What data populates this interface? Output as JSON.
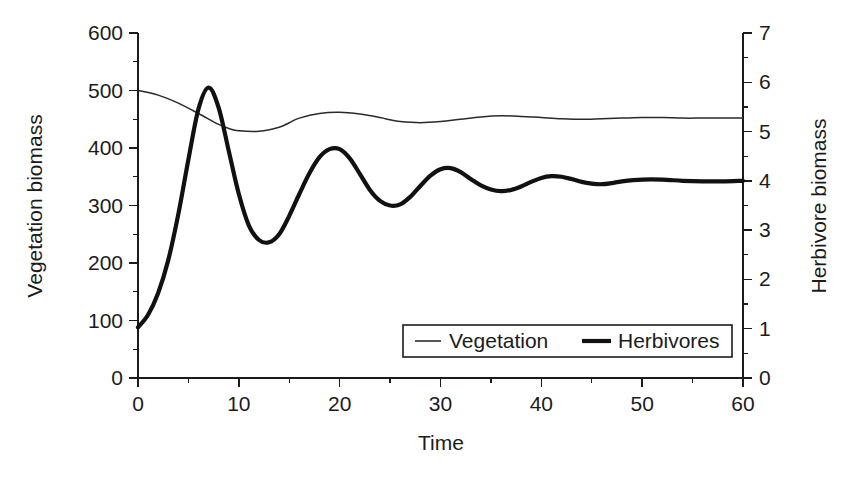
{
  "chart_data": {
    "type": "line",
    "title": "",
    "xlabel": "Time",
    "ylabel": "Vegetation biomass",
    "y2label": "Herbivore biomass",
    "xlim": [
      0,
      60
    ],
    "ylim": [
      0,
      600
    ],
    "y2lim": [
      0,
      7
    ],
    "grid": false,
    "legend_position": "inside-bottom-center",
    "x_ticks": [
      0,
      10,
      20,
      30,
      40,
      50,
      60
    ],
    "x_tick_labels": [
      "0",
      "10",
      "20",
      "30",
      "40",
      "50",
      "60"
    ],
    "x_minor_step": 5,
    "y_ticks": [
      0,
      100,
      200,
      300,
      400,
      500,
      600
    ],
    "y_tick_labels": [
      "0",
      "100",
      "200",
      "300",
      "400",
      "500",
      "600"
    ],
    "y_minor_step": 50,
    "y2_ticks": [
      0,
      1,
      2,
      3,
      4,
      5,
      6,
      7
    ],
    "y2_tick_labels": [
      "0",
      "1",
      "2",
      "3",
      "4",
      "5",
      "6",
      "7"
    ],
    "y2_minor_step": 0.5,
    "series": [
      {
        "name": "Vegetation",
        "axis": "left",
        "style": "thin",
        "color": "#2a2a2a",
        "x": [
          0,
          2,
          4,
          6,
          8,
          9,
          10,
          12,
          14,
          15,
          16,
          18,
          20,
          22,
          24,
          25,
          26,
          28,
          30,
          32,
          34,
          36,
          38,
          40,
          42,
          44,
          46,
          48,
          50,
          52,
          54,
          56,
          58,
          60
        ],
        "values": [
          500,
          492,
          478,
          460,
          441,
          434,
          430,
          429,
          436,
          444,
          452,
          460,
          462,
          459,
          453,
          449,
          446,
          444,
          446,
          450,
          454,
          456,
          455,
          453,
          451,
          450,
          451,
          452,
          453,
          453,
          452,
          452,
          452,
          452
        ]
      },
      {
        "name": "Herbivores",
        "axis": "right",
        "style": "thick",
        "color": "#111111",
        "x": [
          0,
          1,
          2,
          3,
          4,
          5,
          6,
          7,
          8,
          9,
          10,
          11,
          12,
          13,
          14,
          15,
          16,
          17,
          18,
          19,
          20,
          21,
          22,
          23,
          24,
          25,
          26,
          27,
          28,
          29,
          30,
          31,
          32,
          33,
          34,
          35,
          36,
          37,
          38,
          39,
          40,
          41,
          42,
          43,
          44,
          45,
          46,
          47,
          48,
          50,
          52,
          54,
          56,
          58,
          60
        ],
        "values": [
          88,
          110,
          148,
          205,
          285,
          380,
          468,
          505,
          470,
          395,
          320,
          265,
          240,
          236,
          250,
          282,
          320,
          356,
          384,
          398,
          398,
          382,
          355,
          327,
          308,
          300,
          302,
          315,
          334,
          352,
          363,
          365,
          358,
          346,
          335,
          328,
          325,
          327,
          333,
          341,
          348,
          351,
          350,
          346,
          341,
          338,
          337,
          339,
          342,
          345,
          345,
          343,
          342,
          342,
          343
        ],
        "values_right_axis": [
          1.03,
          1.28,
          1.73,
          2.39,
          3.33,
          4.43,
          5.46,
          5.89,
          5.48,
          4.61,
          3.73,
          3.09,
          2.8,
          2.75,
          2.92,
          3.29,
          3.73,
          4.15,
          4.48,
          4.64,
          4.64,
          4.46,
          4.14,
          3.82,
          3.59,
          3.5,
          3.52,
          3.68,
          3.9,
          4.11,
          4.24,
          4.26,
          4.18,
          4.04,
          3.91,
          3.83,
          3.79,
          3.82,
          3.89,
          3.98,
          4.06,
          4.1,
          4.08,
          4.04,
          3.98,
          3.94,
          3.93,
          3.96,
          3.99,
          4.03,
          4.03,
          4.0,
          3.99,
          3.99,
          4.0
        ]
      }
    ],
    "legend_entries": [
      {
        "label": "Vegetation",
        "style": "thin"
      },
      {
        "label": "Herbivores",
        "style": "thick"
      }
    ]
  },
  "colors": {
    "background": "#ffffff",
    "ink": "#1b1b1b",
    "vegetation": "#2a2a2a",
    "herbivores": "#111111"
  }
}
